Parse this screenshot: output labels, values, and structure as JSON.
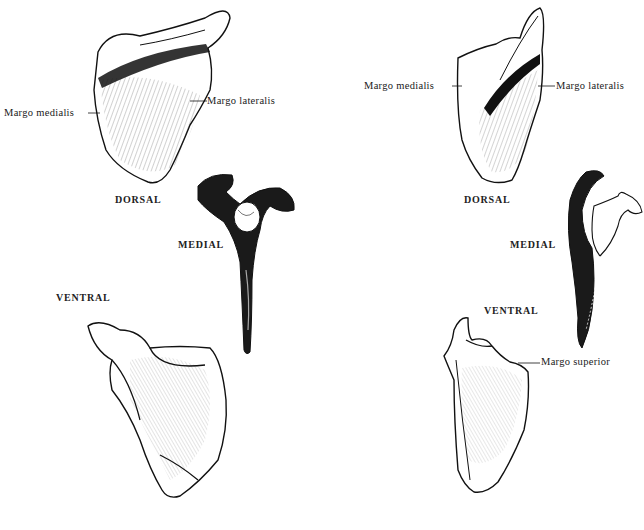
{
  "figure": {
    "left_panel": {
      "view_labels": {
        "dorsal": "DORSAL",
        "medial": "MEDIAL",
        "ventral": "VENTRAL"
      },
      "annotations": {
        "margo_medialis": "Margo medialis",
        "margo_lateralis": "Margo lateralis"
      }
    },
    "right_panel": {
      "view_labels": {
        "dorsal": "DORSAL",
        "medial": "MEDIAL",
        "ventral": "VENTRAL"
      },
      "annotations": {
        "margo_medialis": "Margo medialis",
        "margo_lateralis": "Margo lateralis",
        "margo_superior": "Margo superior"
      }
    },
    "colors": {
      "ink": "#1a1a1a",
      "background": "#ffffff"
    }
  }
}
